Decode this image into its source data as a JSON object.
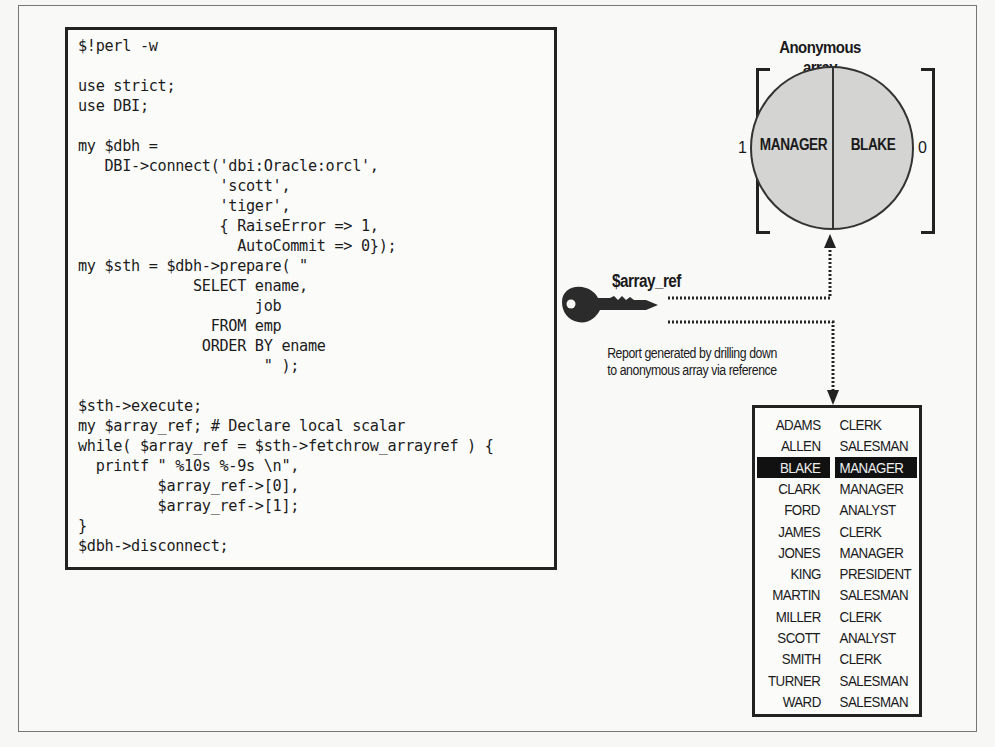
{
  "code_panel": {
    "lines": [
      "$!perl -w",
      "",
      "use strict;",
      "use DBI;",
      "",
      "my $dbh =",
      "   DBI->connect('dbi:Oracle:orcl',",
      "                'scott',",
      "                'tiger',",
      "                { RaiseError => 1,",
      "                  AutoCommit => 0});",
      "my $sth = $dbh->prepare( \"",
      "             SELECT ename,",
      "                    job",
      "               FROM emp",
      "              ORDER BY ename",
      "                     \" );",
      "",
      "$sth->execute;",
      "my $array_ref; # Declare local scalar",
      "while( $array_ref = $sth->fetchrow_arrayref ) {",
      "  printf \" %10s %-9s \\n\",",
      "         $array_ref->[0],",
      "         $array_ref->[1];",
      "}",
      "$dbh->disconnect;"
    ]
  },
  "anonymous_array": {
    "title": "Anonymous array",
    "elements": [
      {
        "index": "1",
        "value": "MANAGER"
      },
      {
        "index": "0",
        "value": "BLAKE"
      }
    ],
    "fill_color": "#d4d4d2"
  },
  "reference": {
    "label": "$array_ref",
    "icon": "key-icon",
    "caption_line1": "Report generated by drilling down",
    "caption_line2": "to anonymous array via reference"
  },
  "report": {
    "highlight_color": "#111111",
    "rows": [
      {
        "name": "ADAMS",
        "job": "CLERK",
        "highlighted": false
      },
      {
        "name": "ALLEN",
        "job": "SALESMAN",
        "highlighted": false
      },
      {
        "name": "BLAKE",
        "job": "MANAGER",
        "highlighted": true
      },
      {
        "name": "CLARK",
        "job": "MANAGER",
        "highlighted": false
      },
      {
        "name": "FORD",
        "job": "ANALYST",
        "highlighted": false
      },
      {
        "name": "JAMES",
        "job": "CLERK",
        "highlighted": false
      },
      {
        "name": "JONES",
        "job": "MANAGER",
        "highlighted": false
      },
      {
        "name": "KING",
        "job": "PRESIDENT",
        "highlighted": false
      },
      {
        "name": "MARTIN",
        "job": "SALESMAN",
        "highlighted": false
      },
      {
        "name": "MILLER",
        "job": "CLERK",
        "highlighted": false
      },
      {
        "name": "SCOTT",
        "job": "ANALYST",
        "highlighted": false
      },
      {
        "name": "SMITH",
        "job": "CLERK",
        "highlighted": false
      },
      {
        "name": "TURNER",
        "job": "SALESMAN",
        "highlighted": false
      },
      {
        "name": "WARD",
        "job": "SALESMAN",
        "highlighted": false
      }
    ]
  }
}
